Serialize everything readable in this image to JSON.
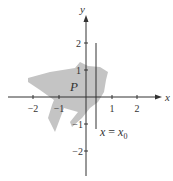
{
  "figure": {
    "region_label": "P",
    "line_label_lhs": "x",
    "line_label_eq": " = ",
    "line_label_rhs": "x",
    "line_label_sub": "0",
    "x_axis_label": "x",
    "y_axis_label": "y",
    "x_ticks": [
      "−2",
      "−1",
      "1",
      "2"
    ],
    "y_ticks": [
      "2",
      "1",
      "−1",
      "−2"
    ],
    "colors": {
      "axis": "#333333",
      "region_fill": "#c4c4c4",
      "background": "#ffffff"
    }
  }
}
